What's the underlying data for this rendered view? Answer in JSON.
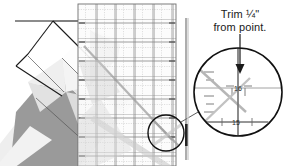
{
  "figure": {
    "type": "quilting-instruction-illustration",
    "background_color": "#ffffff"
  },
  "callout": {
    "line1": "Trim ¼\"",
    "line2": "from point.",
    "arrow": "down-arrow"
  },
  "magnifier": {
    "center_x": 238,
    "center_y": 92,
    "radius": 44,
    "labels": [
      {
        "text": "16",
        "x": 238,
        "y": 88
      },
      {
        "text": "15",
        "x": 236,
        "y": 122
      }
    ],
    "source_circle": {
      "center_x": 166,
      "center_y": 133,
      "radius": 18
    }
  },
  "ruler": {
    "label": "transparent-grid-ruler",
    "x": 78,
    "y": 4,
    "width": 98,
    "height": 162,
    "grid_color": "#8c8c8c",
    "fill_color": "#fbfbfb",
    "major_spacing_px": 19,
    "minor_ticks_per_cell": 8
  },
  "fabric": {
    "dark_color": "#969696",
    "mid_color": "#c4c4c4",
    "light_color": "#e9e9e9",
    "white_color": "#fdfdfd",
    "seam_color": "#1a1a1a"
  },
  "strip": {
    "label": "fabric-edge-strip",
    "x": 186,
    "top": 18,
    "bottom": 160,
    "color": "#3a3a3a"
  },
  "colors": {
    "ink": "#1a1a1a",
    "grid": "#8c8c8c",
    "paper": "#ffffff"
  }
}
